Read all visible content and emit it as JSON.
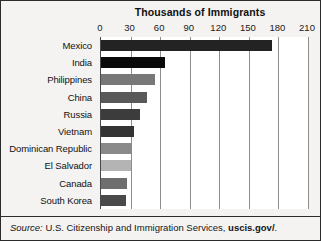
{
  "chart_data": {
    "type": "bar",
    "orientation": "horizontal",
    "title": "Thousands of Immigrants",
    "xlabel": "",
    "ylabel": "",
    "xlim": [
      0,
      210
    ],
    "xticks": [
      0,
      30,
      60,
      90,
      120,
      150,
      180,
      210
    ],
    "xtick_labels": [
      "0",
      "30",
      "60",
      "90",
      "120",
      "150",
      "180",
      "210"
    ],
    "grid": true,
    "legend": "none",
    "categories": [
      "Mexico",
      "India",
      "Philippines",
      "China",
      "Russia",
      "Vietnam",
      "Dominican Republic",
      "El Salvador",
      "Canada",
      "South Korea"
    ],
    "values": [
      173,
      65,
      55,
      47,
      40,
      33,
      31,
      30,
      26,
      25
    ],
    "bar_colors": [
      "#232323",
      "#0a0a0a",
      "#787878",
      "#595959",
      "#3c3c3c",
      "#343434",
      "#8a8a8a",
      "#b4b4b4",
      "#6e6e6e",
      "#4a4a4a"
    ]
  },
  "source": {
    "prefix": "Source:",
    "agency": "U.S. Citizenship and Immigration Services,",
    "link": "uscis.gov/",
    "suffix": "."
  },
  "colors": {
    "figure_background": "#f4f3f1",
    "plot_background": "#ffffff",
    "border": "#2b2b2b",
    "gridline": "#8d8d8d",
    "text": "#111111"
  }
}
